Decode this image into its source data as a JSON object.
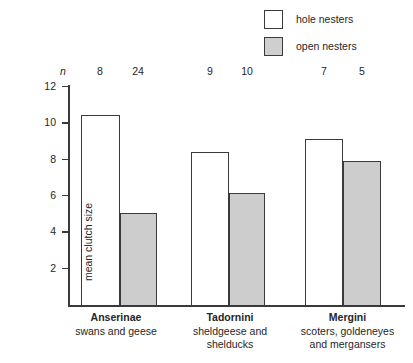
{
  "chart_data": {
    "type": "bar",
    "title": "",
    "subtitle": "",
    "xlabel": "",
    "ylabel": "mean clutch size",
    "ylim": [
      0,
      12
    ],
    "ytick_values": [
      12,
      10,
      8,
      6,
      4,
      2
    ],
    "ytick_labels": [
      "12",
      "10",
      "8",
      "6",
      "4",
      "2"
    ],
    "grid": false,
    "legend_position": "top-right",
    "categories": [
      "Anserinae",
      "Tadornini",
      "Mergini"
    ],
    "category_subtitles": [
      "swans and geese",
      "sheldgeese and\nshelducks",
      "scoters, goldeneyes\nand mergansers"
    ],
    "series": [
      {
        "name": "hole nesters",
        "color": "#ffffff",
        "values": [
          10.4,
          8.4,
          9.1
        ]
      },
      {
        "name": "open nesters",
        "color": "#cdcdcd",
        "values": [
          5.05,
          6.15,
          7.9
        ]
      }
    ],
    "annotations": {
      "n_symbol": "n",
      "n_label": "n",
      "sample_sizes": [
        {
          "group": "Anserinae",
          "series": "hole nesters",
          "n": 8
        },
        {
          "group": "Anserinae",
          "series": "open nesters",
          "n": 24
        },
        {
          "group": "Tadornini",
          "series": "hole nesters",
          "n": 9
        },
        {
          "group": "Tadornini",
          "series": "open nesters",
          "n": 10
        },
        {
          "group": "Mergini",
          "series": "hole nesters",
          "n": 7
        },
        {
          "group": "Mergini",
          "series": "open nesters",
          "n": 5
        }
      ]
    }
  },
  "legend": {
    "items": [
      {
        "label": "hole nesters",
        "swatch": "white-square"
      },
      {
        "label": "open nesters",
        "swatch": "gray-square"
      }
    ]
  },
  "n_row": {
    "symbol": "n",
    "values": [
      "8",
      "24",
      "9",
      "10",
      "7",
      "5"
    ]
  },
  "axis": {
    "y_title": "mean clutch size",
    "y_ticks": [
      "12",
      "10",
      "8",
      "6",
      "4",
      "2"
    ]
  },
  "groups": [
    {
      "name": "Anserinae",
      "lines": [
        "swans and geese"
      ]
    },
    {
      "name": "Tadornini",
      "lines": [
        "sheldgeese and",
        "shelducks"
      ]
    },
    {
      "name": "Mergini",
      "lines": [
        "scoters, goldeneyes",
        "and mergansers"
      ]
    }
  ],
  "colors": {
    "hole_nesters": "#ffffff",
    "open_nesters": "#cdcdcd",
    "axis": "#3a3a3a",
    "text": "#262626",
    "background": "#ffffff"
  }
}
